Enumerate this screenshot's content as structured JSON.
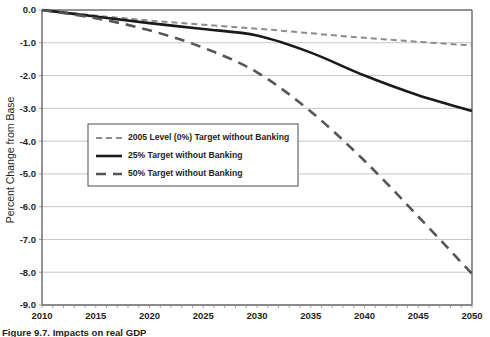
{
  "figure": {
    "caption": "Figure 9.7. Impacts on real GDP"
  },
  "chart_data": {
    "type": "line",
    "title": "",
    "xlabel": "",
    "ylabel": "Percent Change from Base",
    "xlim": [
      2010,
      2050
    ],
    "ylim": [
      -9.0,
      0.0
    ],
    "grid": true,
    "legend_position": "center-left-inside",
    "x_ticks": [
      2010,
      2015,
      2020,
      2025,
      2030,
      2035,
      2040,
      2045,
      2050
    ],
    "x_tick_labels": [
      "2010",
      "2015",
      "2020",
      "2025",
      "2030",
      "2035",
      "2040",
      "2045",
      "2050"
    ],
    "y_ticks": [
      0.0,
      -1.0,
      -2.0,
      -3.0,
      -4.0,
      -5.0,
      -6.0,
      -7.0,
      -8.0,
      -9.0
    ],
    "y_tick_labels": [
      "0.0",
      "-1.0",
      "-2.0",
      "-3.0",
      "-4.0",
      "-5.0",
      "-6.0",
      "-7.0",
      "-8.0",
      "-9.0"
    ],
    "x": [
      2010,
      2015,
      2020,
      2025,
      2030,
      2035,
      2040,
      2045,
      2050
    ],
    "series": [
      {
        "name": "2005 Level (0%) Target without Banking",
        "style": "dashed-light",
        "color": "#8c8c8c",
        "width": 2.0,
        "dash": "6,4",
        "values": [
          0.0,
          -0.17,
          -0.32,
          -0.45,
          -0.57,
          -0.71,
          -0.85,
          -0.97,
          -1.08
        ]
      },
      {
        "name": "25% Target without Banking",
        "style": "solid",
        "color": "#1a1a1a",
        "width": 2.6,
        "dash": "",
        "values": [
          0.0,
          -0.2,
          -0.4,
          -0.58,
          -0.78,
          -1.3,
          -2.0,
          -2.6,
          -3.08
        ]
      },
      {
        "name": "50% Target without Banking",
        "style": "dashed-dark",
        "color": "#555555",
        "width": 2.6,
        "dash": "10,7",
        "values": [
          0.0,
          -0.25,
          -0.62,
          -1.15,
          -1.9,
          -3.1,
          -4.6,
          -6.3,
          -8.05
        ]
      }
    ]
  },
  "plot": {
    "frame_color": "#6e6e6e",
    "gridline_color": "#bfbfbf",
    "background": "#ffffff"
  },
  "legend": {
    "entries": [
      {
        "label": "2005 Level (0%) Target without Banking"
      },
      {
        "label": "25% Target without Banking"
      },
      {
        "label": "50% Target without Banking"
      }
    ]
  }
}
